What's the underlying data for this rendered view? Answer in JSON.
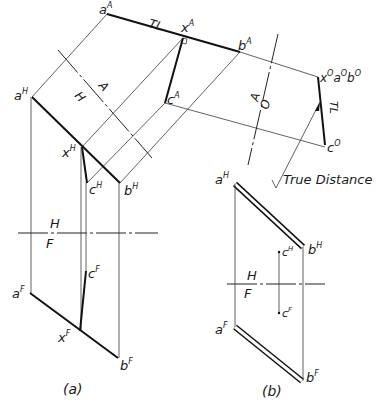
{
  "figure_a": {
    "caption": "(a)",
    "labels": {
      "aA": "a",
      "aA_sup": "A",
      "xA": "x",
      "xA_sup": "A",
      "bA": "b",
      "bA_sup": "A",
      "cA": "c",
      "cA_sup": "A",
      "TL_top": "TL",
      "aH": "a",
      "aH_sup": "H",
      "xH": "x",
      "xH_sup": "H",
      "bH": "b",
      "bH_sup": "H",
      "cH": "c",
      "cH_sup": "H",
      "aF": "a",
      "aF_sup": "F",
      "xF": "x",
      "xF_sup": "F",
      "bF": "b",
      "bF_sup": "F",
      "cF": "c",
      "cF_sup": "F",
      "x0a0b0": "x",
      "x0a0b0_sup1": "O",
      "x0a0b0_a": "a",
      "x0a0b0_sup2": "O",
      "x0a0b0_b": "b",
      "x0a0b0_sup3": "O",
      "c0": "c",
      "c0_sup": "O",
      "TL_right": "TL",
      "true_distance": "True Distance"
    },
    "fold_lines": {
      "HA_upper": "A",
      "HA_lower": "H",
      "AO_upper": "A",
      "AO_lower": "O",
      "HF_upper": "H",
      "HF_lower": "F"
    }
  },
  "figure_b": {
    "caption": "(b)",
    "labels": {
      "aH": "a",
      "aH_sup": "H",
      "bH": "b",
      "bH_sup": "H",
      "cH": "c",
      "cH_sup": "H",
      "cF": "c",
      "cF_sup": "F",
      "aF": "a",
      "aF_sup": "F",
      "bF": "b",
      "bF_sup": "F"
    },
    "fold_lines": {
      "HF_upper": "H",
      "HF_lower": "F"
    }
  }
}
